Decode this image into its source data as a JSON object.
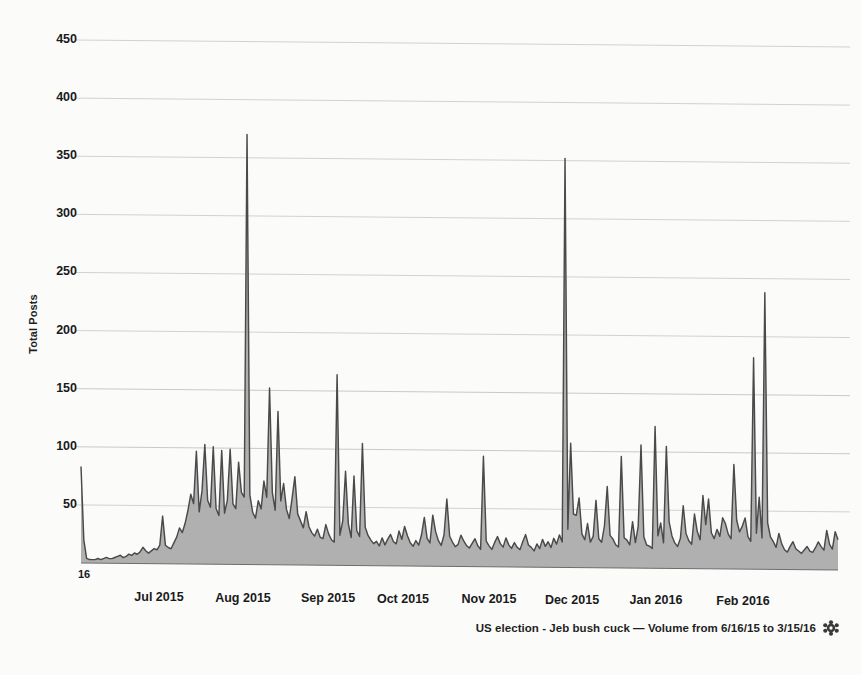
{
  "chart_data": {
    "type": "area",
    "title": "",
    "subtitle": "",
    "xlabel": "",
    "ylabel": "Total Posts",
    "ylim": [
      0,
      450
    ],
    "yticks": [
      50,
      100,
      150,
      200,
      250,
      300,
      350,
      400,
      450
    ],
    "grid": true,
    "legend": null,
    "origin_tick_label": "16",
    "xtick_labels": [
      "Jul 2015",
      "Aug 2015",
      "Sep 2015",
      "Oct 2015",
      "Nov 2015",
      "Dec 2015",
      "Jan 2016",
      "Feb 2016"
    ],
    "x_start_date": "6/16/15",
    "x_end_date": "3/15/16",
    "series": [
      {
        "name": "US election - Jeb bush cuck",
        "fill_color": "#a9a9a9",
        "line_color": "#4a4a4a",
        "values": [
          83,
          20,
          4,
          3,
          3,
          3,
          4,
          3,
          4,
          5,
          4,
          4,
          5,
          6,
          7,
          5,
          6,
          8,
          7,
          9,
          8,
          10,
          14,
          11,
          9,
          11,
          13,
          12,
          16,
          41,
          16,
          14,
          13,
          18,
          23,
          31,
          27,
          35,
          46,
          60,
          52,
          97,
          45,
          63,
          103,
          55,
          49,
          101,
          48,
          42,
          98,
          44,
          55,
          99,
          52,
          48,
          88,
          62,
          58,
          370,
          60,
          45,
          40,
          55,
          48,
          72,
          58,
          152,
          62,
          47,
          132,
          55,
          70,
          48,
          40,
          57,
          76,
          44,
          38,
          32,
          46,
          33,
          28,
          25,
          31,
          24,
          23,
          35,
          27,
          22,
          20,
          164,
          26,
          38,
          81,
          36,
          24,
          77,
          30,
          25,
          105,
          33,
          26,
          22,
          19,
          21,
          17,
          24,
          18,
          23,
          27,
          21,
          19,
          30,
          23,
          34,
          26,
          20,
          17,
          22,
          18,
          27,
          42,
          24,
          20,
          44,
          30,
          22,
          18,
          27,
          58,
          26,
          21,
          17,
          19,
          27,
          22,
          18,
          16,
          20,
          24,
          18,
          15,
          95,
          22,
          18,
          15,
          21,
          26,
          20,
          17,
          25,
          19,
          16,
          21,
          17,
          15,
          22,
          28,
          19,
          17,
          14,
          20,
          16,
          24,
          18,
          22,
          17,
          25,
          20,
          28,
          22,
          352,
          33,
          107,
          46,
          45,
          60,
          29,
          24,
          38,
          22,
          27,
          58,
          25,
          22,
          36,
          70,
          28,
          25,
          20,
          18,
          96,
          26,
          24,
          20,
          40,
          22,
          36,
          106,
          27,
          20,
          19,
          17,
          122,
          28,
          39,
          22,
          105,
          40,
          28,
          22,
          19,
          26,
          54,
          30,
          24,
          21,
          47,
          32,
          25,
          63,
          38,
          60,
          31,
          26,
          34,
          28,
          44,
          39,
          30,
          26,
          90,
          42,
          32,
          37,
          44,
          28,
          24,
          182,
          31,
          62,
          27,
          238,
          40,
          28,
          24,
          19,
          31,
          22,
          17,
          15,
          20,
          24,
          18,
          16,
          14,
          17,
          20,
          16,
          15,
          19,
          24,
          20,
          17,
          34,
          22,
          18,
          33,
          26
        ]
      }
    ]
  },
  "caption": {
    "text": "US election - Jeb bush cuck — Volume from 6/16/15 to 3/15/16",
    "settings_icon": "gear-icon"
  },
  "colors": {
    "background": "#fbfbfa",
    "grid": "#b9b9b9",
    "fill": "#a9a9a9",
    "line": "#4a4a4a",
    "text": "#1a1a1a"
  }
}
